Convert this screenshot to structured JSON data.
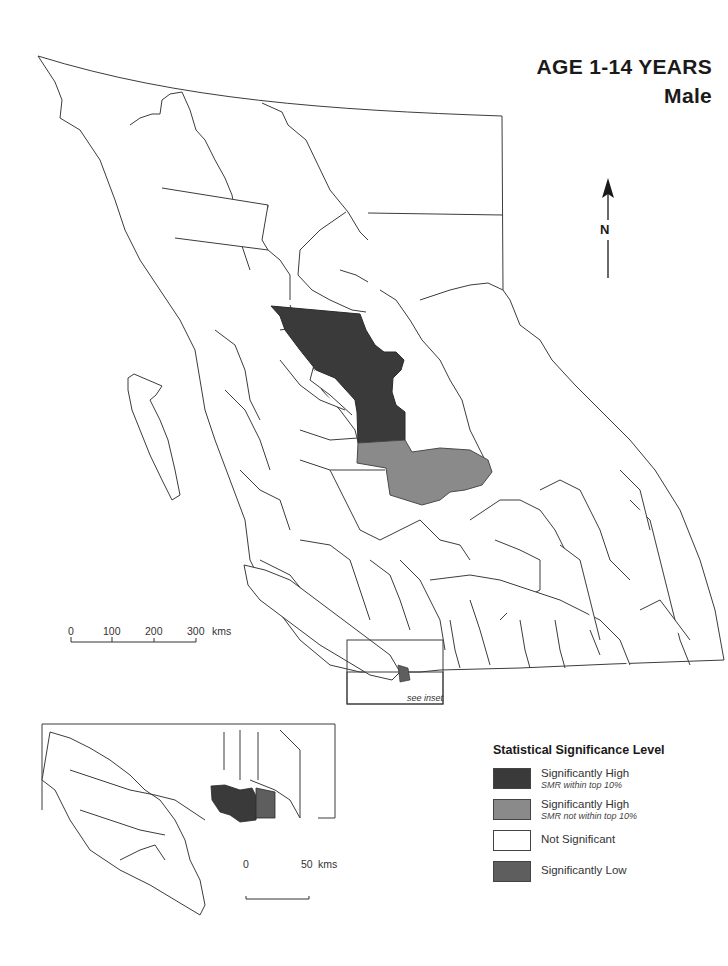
{
  "title": {
    "line1": "AGE 1-14 YEARS",
    "line2": "Male"
  },
  "north_arrow": {
    "label": "N"
  },
  "colors": {
    "sig_high_top10": "#3a3a3a",
    "sig_high_not_top10": "#8a8a8a",
    "not_significant": "#ffffff",
    "sig_low": "#5e5e5e",
    "border": "#3c3c3c"
  },
  "main_scale": {
    "ticks": [
      "0",
      "100",
      "200",
      "300"
    ],
    "unit": "kms"
  },
  "inset_box_label": "see inset",
  "inset_scale": {
    "ticks": [
      "0",
      "50"
    ],
    "unit": "kms"
  },
  "legend": {
    "title": "Statistical Significance Level",
    "items": [
      {
        "label": "Significantly High",
        "sublabel": "SMR within top 10%",
        "color": "#3a3a3a"
      },
      {
        "label": "Significantly High",
        "sublabel": "SMR not within top 10%",
        "color": "#8a8a8a"
      },
      {
        "label": "Not Significant",
        "sublabel": "",
        "color": "#ffffff"
      },
      {
        "label": "Significantly Low",
        "sublabel": "",
        "color": "#5e5e5e"
      }
    ]
  }
}
